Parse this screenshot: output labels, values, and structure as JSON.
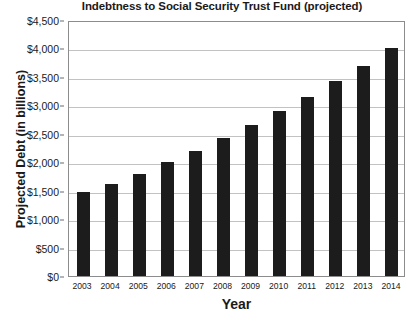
{
  "chart_data": {
    "type": "bar",
    "title": "Indebtness to Social Security Trust Fund (projected)",
    "xlabel": "Year",
    "ylabel": "Projected Debt (in billions)",
    "categories": [
      "2003",
      "2004",
      "2005",
      "2006",
      "2007",
      "2008",
      "2009",
      "2010",
      "2011",
      "2012",
      "2013",
      "2014"
    ],
    "values": [
      1475,
      1625,
      1800,
      2000,
      2200,
      2425,
      2650,
      2900,
      3150,
      3425,
      3700,
      4000
    ],
    "ylim": [
      0,
      4500
    ],
    "ytick_values": [
      0,
      500,
      1000,
      1500,
      2000,
      2500,
      3000,
      3500,
      4000,
      4500
    ],
    "ytick_labels": [
      "$0",
      "$500",
      "$1,000",
      "$1,500",
      "$2,000",
      "$2,500",
      "$3,000",
      "$3,500",
      "$4,000",
      "$4,500"
    ],
    "grid": true,
    "legend": false,
    "bar_color": "#1c1c1c",
    "gridline_color": "#c2c2c2",
    "frame_color": "#8c8c8c",
    "background_color": "#ffffff"
  }
}
